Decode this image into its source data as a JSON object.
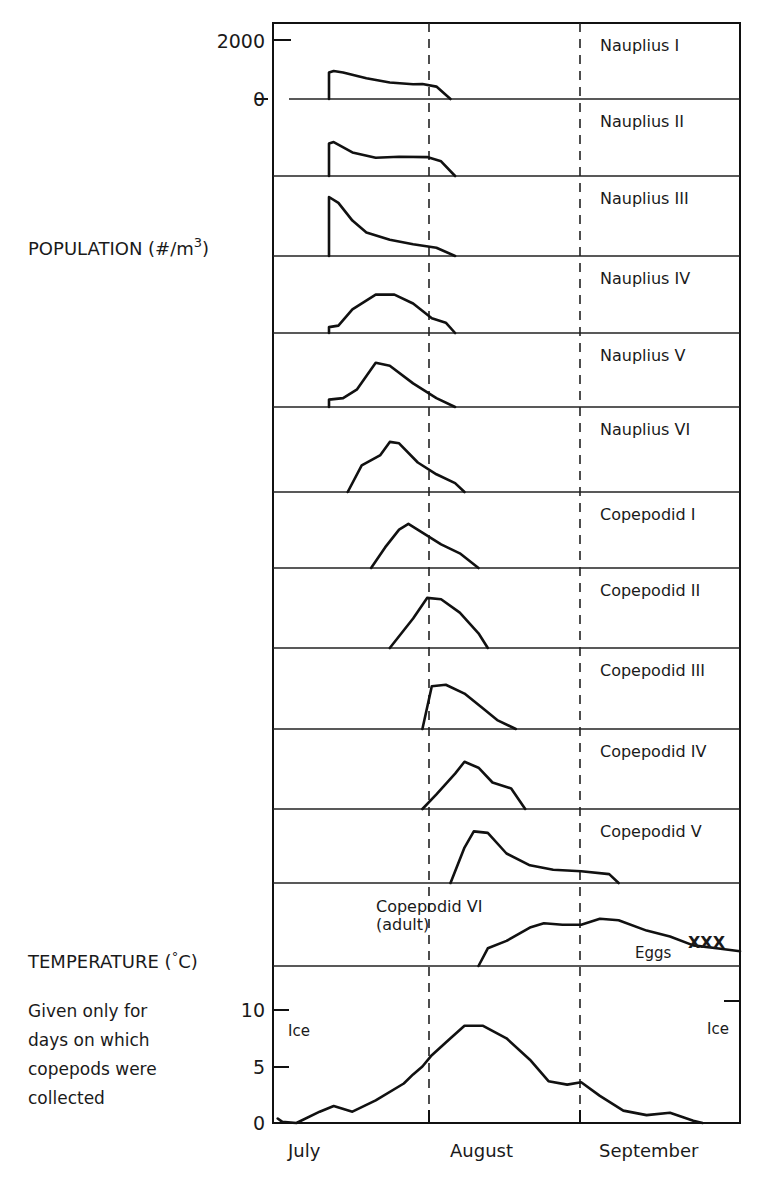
{
  "chart_data": {
    "type": "line",
    "title": "",
    "layout": "stacked small-multiples (12 population panels + 1 temperature panel)",
    "population_axis": {
      "label": "POPULATION (#/m",
      "label_superscript": "3",
      "label_suffix": ")",
      "ticks": [
        {
          "label": "2000",
          "value": 2000
        },
        {
          "label": "0",
          "value": 0
        }
      ],
      "ylim": [
        0,
        2000
      ]
    },
    "temperature_axis": {
      "label": "TEMPERATURE (",
      "label_degree": "°",
      "label_suffix": "C)",
      "note_lines": [
        "Given only for",
        "days on which",
        "copepods were",
        "collected"
      ],
      "ticks": [
        {
          "label": "10",
          "value": 10
        },
        {
          "label": "5",
          "value": 5
        },
        {
          "label": "0",
          "value": 0
        }
      ],
      "ylim": [
        0,
        12
      ]
    },
    "x_axis": {
      "categories": [
        "July",
        "August",
        "September"
      ],
      "month_dividers": [
        "July/August",
        "August/September"
      ],
      "xlabel": ""
    },
    "series": [
      {
        "name": "Nauplius I",
        "approx_peak": 950,
        "start": "mid July",
        "end": "late July",
        "points": [
          [
            0.12,
            0
          ],
          [
            0.12,
            900
          ],
          [
            0.13,
            950
          ],
          [
            0.15,
            900
          ],
          [
            0.2,
            700
          ],
          [
            0.25,
            560
          ],
          [
            0.3,
            500
          ],
          [
            0.32,
            510
          ],
          [
            0.35,
            420
          ],
          [
            0.38,
            0
          ]
        ]
      },
      {
        "name": "Nauplius II",
        "approx_peak": 1150,
        "start": "mid July",
        "end": "end July",
        "points": [
          [
            0.12,
            0
          ],
          [
            0.12,
            1100
          ],
          [
            0.13,
            1150
          ],
          [
            0.17,
            800
          ],
          [
            0.22,
            620
          ],
          [
            0.27,
            650
          ],
          [
            0.33,
            640
          ],
          [
            0.36,
            500
          ],
          [
            0.39,
            0
          ]
        ]
      },
      {
        "name": "Nauplius III",
        "approx_peak": 2000,
        "start": "mid July",
        "end": "end July",
        "points": [
          [
            0.12,
            0
          ],
          [
            0.12,
            2000
          ],
          [
            0.14,
            1800
          ],
          [
            0.17,
            1200
          ],
          [
            0.2,
            800
          ],
          [
            0.25,
            550
          ],
          [
            0.3,
            400
          ],
          [
            0.35,
            280
          ],
          [
            0.39,
            0
          ]
        ]
      },
      {
        "name": "Nauplius IV",
        "approx_peak": 1300,
        "start": "mid July",
        "end": "end July",
        "points": [
          [
            0.12,
            0
          ],
          [
            0.12,
            200
          ],
          [
            0.14,
            250
          ],
          [
            0.17,
            800
          ],
          [
            0.22,
            1300
          ],
          [
            0.26,
            1300
          ],
          [
            0.3,
            1000
          ],
          [
            0.34,
            500
          ],
          [
            0.37,
            350
          ],
          [
            0.39,
            0
          ]
        ]
      },
      {
        "name": "Nauplius V",
        "approx_peak": 1500,
        "start": "mid July",
        "end": "end July",
        "points": [
          [
            0.12,
            0
          ],
          [
            0.12,
            250
          ],
          [
            0.15,
            300
          ],
          [
            0.18,
            600
          ],
          [
            0.22,
            1500
          ],
          [
            0.25,
            1400
          ],
          [
            0.3,
            800
          ],
          [
            0.35,
            300
          ],
          [
            0.39,
            0
          ]
        ]
      },
      {
        "name": "Nauplius VI",
        "approx_peak": 1700,
        "start": "late July",
        "end": "early August",
        "points": [
          [
            0.16,
            0
          ],
          [
            0.19,
            900
          ],
          [
            0.23,
            1250
          ],
          [
            0.25,
            1700
          ],
          [
            0.27,
            1650
          ],
          [
            0.31,
            1000
          ],
          [
            0.35,
            600
          ],
          [
            0.39,
            300
          ],
          [
            0.41,
            0
          ]
        ]
      },
      {
        "name": "Copepodid I",
        "approx_peak": 1500,
        "start": "late July",
        "end": "early August",
        "points": [
          [
            0.21,
            0
          ],
          [
            0.24,
            700
          ],
          [
            0.27,
            1300
          ],
          [
            0.29,
            1500
          ],
          [
            0.32,
            1200
          ],
          [
            0.36,
            800
          ],
          [
            0.4,
            500
          ],
          [
            0.44,
            0
          ]
        ]
      },
      {
        "name": "Copepodid II",
        "approx_peak": 1750,
        "start": "late July",
        "end": "early August",
        "points": [
          [
            0.25,
            0
          ],
          [
            0.3,
            1000
          ],
          [
            0.33,
            1700
          ],
          [
            0.36,
            1650
          ],
          [
            0.4,
            1200
          ],
          [
            0.44,
            500
          ],
          [
            0.46,
            0
          ]
        ]
      },
      {
        "name": "Copepodid III",
        "approx_peak": 1500,
        "start": "end July",
        "end": "mid August",
        "points": [
          [
            0.32,
            0
          ],
          [
            0.34,
            1450
          ],
          [
            0.37,
            1500
          ],
          [
            0.41,
            1200
          ],
          [
            0.45,
            700
          ],
          [
            0.48,
            300
          ],
          [
            0.52,
            0
          ]
        ]
      },
      {
        "name": "Copepodid IV",
        "approx_peak": 1600,
        "start": "end July",
        "end": "mid August",
        "points": [
          [
            0.32,
            0
          ],
          [
            0.35,
            500
          ],
          [
            0.39,
            1200
          ],
          [
            0.41,
            1600
          ],
          [
            0.44,
            1400
          ],
          [
            0.47,
            900
          ],
          [
            0.51,
            700
          ],
          [
            0.54,
            0
          ]
        ]
      },
      {
        "name": "Copepodid V",
        "approx_peak": 1800,
        "start": "early August",
        "end": "end August",
        "points": [
          [
            0.38,
            0
          ],
          [
            0.41,
            1200
          ],
          [
            0.43,
            1750
          ],
          [
            0.46,
            1700
          ],
          [
            0.5,
            1000
          ],
          [
            0.55,
            600
          ],
          [
            0.6,
            450
          ],
          [
            0.66,
            400
          ],
          [
            0.72,
            300
          ],
          [
            0.74,
            0
          ]
        ]
      },
      {
        "name": "Copepodid VI (adult)",
        "approx_peak": 1600,
        "start": "mid August",
        "end": "beyond September",
        "annotations": [
          "Eggs",
          "XXX"
        ],
        "points": [
          [
            0.44,
            0
          ],
          [
            0.46,
            600
          ],
          [
            0.5,
            850
          ],
          [
            0.55,
            1300
          ],
          [
            0.58,
            1450
          ],
          [
            0.62,
            1400
          ],
          [
            0.66,
            1400
          ],
          [
            0.7,
            1600
          ],
          [
            0.74,
            1550
          ],
          [
            0.8,
            1200
          ],
          [
            0.85,
            1000
          ],
          [
            0.9,
            700
          ],
          [
            0.95,
            600
          ],
          [
            1.0,
            500
          ]
        ]
      }
    ],
    "temperature": {
      "name": "Temperature",
      "annotations": [
        {
          "text": "Ice",
          "position": "start"
        },
        {
          "text": "Ice",
          "position": "end"
        }
      ],
      "points": [
        [
          0.01,
          0.4
        ],
        [
          0.02,
          0.1
        ],
        [
          0.05,
          0
        ],
        [
          0.1,
          1.0
        ],
        [
          0.13,
          1.5
        ],
        [
          0.17,
          1.0
        ],
        [
          0.22,
          2.0
        ],
        [
          0.28,
          3.5
        ],
        [
          0.3,
          4.3
        ],
        [
          0.32,
          5.0
        ],
        [
          0.34,
          6.0
        ],
        [
          0.38,
          7.5
        ],
        [
          0.41,
          8.6
        ],
        [
          0.45,
          8.6
        ],
        [
          0.5,
          7.5
        ],
        [
          0.55,
          5.6
        ],
        [
          0.59,
          3.7
        ],
        [
          0.63,
          3.4
        ],
        [
          0.66,
          3.6
        ],
        [
          0.7,
          2.4
        ],
        [
          0.75,
          1.1
        ],
        [
          0.8,
          0.7
        ],
        [
          0.85,
          0.9
        ],
        [
          0.9,
          0.2
        ],
        [
          0.92,
          0
        ]
      ]
    },
    "grid": false,
    "legend": "stage names as in-panel labels at right"
  }
}
